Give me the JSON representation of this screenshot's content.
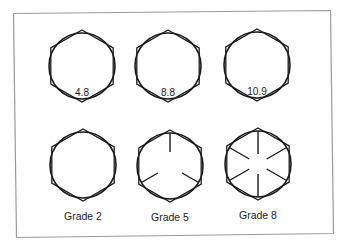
{
  "figure": {
    "colors": {
      "stroke": "#1a1a1a",
      "frame": "#9a9a9a",
      "background": "#ffffff"
    }
  },
  "metric_row": {
    "bolts": [
      {
        "label": "4.8",
        "cx": 82,
        "cy": 66
      },
      {
        "label": "8.8",
        "cx": 168,
        "cy": 66
      },
      {
        "label": "10.9",
        "cx": 257,
        "cy": 65
      }
    ]
  },
  "sae_row": {
    "bolts": [
      {
        "label": "Grade 2",
        "radial_lines": 0,
        "cx": 83,
        "cy": 165
      },
      {
        "label": "Grade 5",
        "radial_lines": 3,
        "cx": 170,
        "cy": 166
      },
      {
        "label": "Grade 8",
        "radial_lines": 6,
        "cx": 258,
        "cy": 164
      }
    ]
  }
}
